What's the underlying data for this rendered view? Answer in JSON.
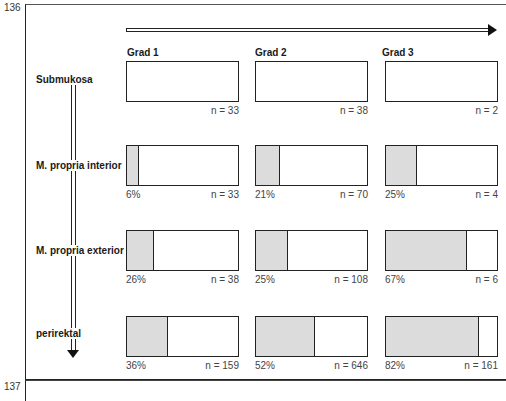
{
  "page_numbers": {
    "top": "136",
    "bottom": "137"
  },
  "grades": [
    "Grad 1",
    "Grad 2",
    "Grad 3"
  ],
  "rows": [
    {
      "label": "Submukosa",
      "cells": [
        {
          "pct_label": "",
          "fraction": 0,
          "n": "n = 33"
        },
        {
          "pct_label": "",
          "fraction": 0,
          "n": "n = 38"
        },
        {
          "pct_label": "",
          "fraction": 0,
          "n": "n = 2"
        }
      ]
    },
    {
      "label": "M. propria interior",
      "cells": [
        {
          "pct_label": "6%",
          "fraction": 0.1,
          "n": "n = 33"
        },
        {
          "pct_label": "21%",
          "fraction": 0.21,
          "n": "n = 70"
        },
        {
          "pct_label": "25%",
          "fraction": 0.27,
          "n": "n = 4"
        }
      ]
    },
    {
      "label": "M. propria exterior",
      "cells": [
        {
          "pct_label": "26%",
          "fraction": 0.23,
          "n": "n = 38"
        },
        {
          "pct_label": "25%",
          "fraction": 0.28,
          "n": "n = 108"
        },
        {
          "pct_label": "67%",
          "fraction": 0.72,
          "n": "n = 6"
        }
      ]
    },
    {
      "label": "perirektal",
      "cells": [
        {
          "pct_label": "36%",
          "fraction": 0.36,
          "n": "n = 159"
        },
        {
          "pct_label": "52%",
          "fraction": 0.52,
          "n": "n = 646"
        },
        {
          "pct_label": "82%",
          "fraction": 0.83,
          "n": "n = 161"
        }
      ]
    }
  ],
  "colors": {
    "fill": "#dcdcdc",
    "line": "#222222"
  }
}
